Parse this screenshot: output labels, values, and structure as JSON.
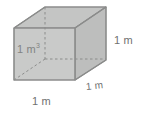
{
  "figure": {
    "shape": "cube",
    "colors": {
      "front_face_fill": "#c9cac9",
      "top_face_fill": "#c4c5c4",
      "right_face_fill": "#bdbebd",
      "edge_stroke": "#8b8c8b",
      "hidden_edge_stroke": "#8b8c8b",
      "label_text": "#6f7170",
      "background": "#ffffff"
    },
    "labels": {
      "volume_value": "1 m",
      "volume_exponent": "3",
      "height": "1 m",
      "width": "1 m",
      "depth": "1 m"
    }
  }
}
